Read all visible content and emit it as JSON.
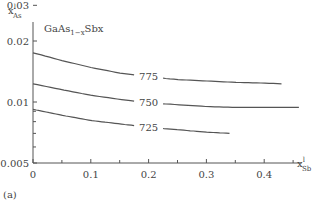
{
  "chart_data": {
    "type": "line",
    "title_main": "GaAs",
    "title_sub": "1−x",
    "title_tail": "Sbx",
    "panel_label": "(a)",
    "xlabel": "x",
    "xlabel_sup": "l",
    "xlabel_sub": "Sb",
    "ylabel": "x",
    "ylabel_sup": "l",
    "ylabel_sub": "As",
    "yscale": "log",
    "xlim": [
      0,
      0.47
    ],
    "ylim": [
      0.005,
      0.035
    ],
    "x_ticks": [
      "0",
      "0.1",
      "0.2",
      "0.3",
      "0.4"
    ],
    "y_ticks": [
      "0.005",
      "0.01",
      "0.02",
      "0.03"
    ],
    "grid": false,
    "series": [
      {
        "name": "775",
        "label": "775",
        "x": [
          0,
          0.05,
          0.1,
          0.15,
          0.2,
          0.25,
          0.3,
          0.35,
          0.4,
          0.43
        ],
        "y": [
          0.0175,
          0.016,
          0.0148,
          0.0139,
          0.0133,
          0.0129,
          0.0127,
          0.0125,
          0.0124,
          0.0123
        ]
      },
      {
        "name": "750",
        "label": "750",
        "x": [
          0,
          0.05,
          0.1,
          0.15,
          0.2,
          0.25,
          0.3,
          0.35,
          0.4,
          0.46
        ],
        "y": [
          0.0123,
          0.0115,
          0.0108,
          0.0103,
          0.0099,
          0.0097,
          0.0095,
          0.0094,
          0.0094,
          0.0094
        ]
      },
      {
        "name": "725",
        "label": "725",
        "x": [
          0,
          0.05,
          0.1,
          0.15,
          0.2,
          0.25,
          0.3,
          0.34
        ],
        "y": [
          0.0092,
          0.0086,
          0.0081,
          0.0078,
          0.0075,
          0.0073,
          0.0071,
          0.007
        ]
      }
    ]
  }
}
